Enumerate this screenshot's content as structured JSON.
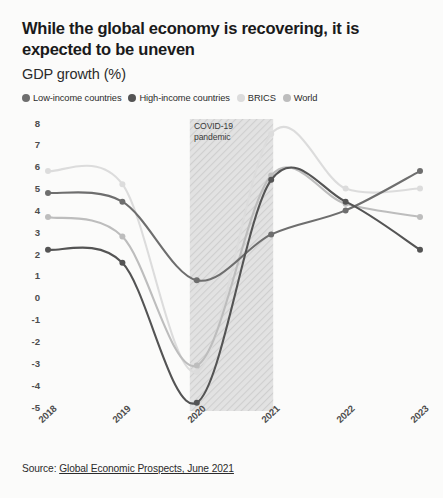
{
  "header": {
    "title": "While the global economy is recovering, it is expected to be uneven",
    "subtitle": "GDP growth (%)"
  },
  "source": {
    "prefix": "Source: ",
    "link_text": "Global Economic Prospects, June 2021"
  },
  "annotations": {
    "covid_line1": "COVID-19",
    "covid_line2": "pandemic"
  },
  "colors": {
    "low_income": "#6e6e6e",
    "high_income": "#545454",
    "brics": "#dcdcdc",
    "world": "#bdbdbd",
    "band": "#d9d9d9",
    "axis_text": "#4d4d4d",
    "background": "#fbfbfa"
  },
  "chart_data": {
    "type": "line",
    "title": "While the global economy is recovering, it is expected to be uneven",
    "subtitle": "GDP growth (%)",
    "xlabel": "",
    "ylabel": "GDP growth (%)",
    "x": [
      "2018",
      "2019",
      "2020",
      "2021",
      "2022",
      "2023"
    ],
    "categories": [
      "2018",
      "2019",
      "2020",
      "2021",
      "2022",
      "2023"
    ],
    "ylim": [
      -5,
      8
    ],
    "yticks": [
      8,
      7,
      6,
      5,
      4,
      3,
      2,
      1,
      0,
      -1,
      -2,
      -3,
      -4,
      -5
    ],
    "ytick_labels": [
      "8",
      "7",
      "6",
      "5",
      "4",
      "3",
      "2",
      "1",
      "0",
      "-1",
      "-2",
      "-3",
      "-4",
      "-5"
    ],
    "grid": false,
    "legend_position": "top",
    "series": [
      {
        "name": "Low-income countries",
        "color": "#6e6e6e",
        "values": [
          4.8,
          4.4,
          0.8,
          2.9,
          4.0,
          5.8
        ]
      },
      {
        "name": "High-income countries",
        "color": "#545454",
        "values": [
          2.2,
          1.6,
          -4.8,
          5.4,
          4.4,
          2.2
        ]
      },
      {
        "name": "BRICS",
        "color": "#dcdcdc",
        "values": [
          5.8,
          5.2,
          -3.4,
          7.5,
          5.0,
          5.0
        ]
      },
      {
        "name": "World",
        "color": "#bdbdbd",
        "values": [
          3.7,
          2.8,
          -3.1,
          5.6,
          4.3,
          3.7
        ]
      }
    ],
    "shaded_region": {
      "label": "COVID-19 pandemic",
      "from": "2020",
      "to": "2021",
      "style": "hatched"
    }
  }
}
